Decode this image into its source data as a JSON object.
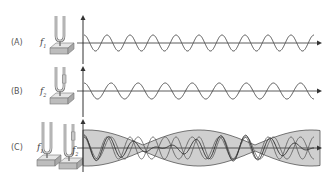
{
  "diagram": {
    "colors": {
      "wave": "#555555",
      "axis": "#333333",
      "envelope_fill": "#cfcfcf",
      "envelope_stroke": "#555555",
      "fork": "#777777",
      "base": "#bdbdbd"
    },
    "rows": [
      {
        "id": "a",
        "label": "(A)",
        "freq_label": "f",
        "freq_sub": "1",
        "cycles": 10,
        "phase_start": "peak",
        "type": "single"
      },
      {
        "id": "b",
        "label": "(B)",
        "freq_label": "f",
        "freq_sub": "2",
        "cycles": 8.5,
        "phase_start": "peak",
        "type": "single",
        "fork_has_weight": true
      },
      {
        "id": "c",
        "label": "(C)",
        "freq_label_1": "f",
        "freq_sub_1": "1",
        "freq_label_2": "f",
        "freq_sub_2": "2",
        "type": "beats",
        "beat_nodes_x": [
          143,
          255
        ]
      }
    ],
    "axis": {
      "x_start": 83,
      "x_end": 322
    }
  }
}
